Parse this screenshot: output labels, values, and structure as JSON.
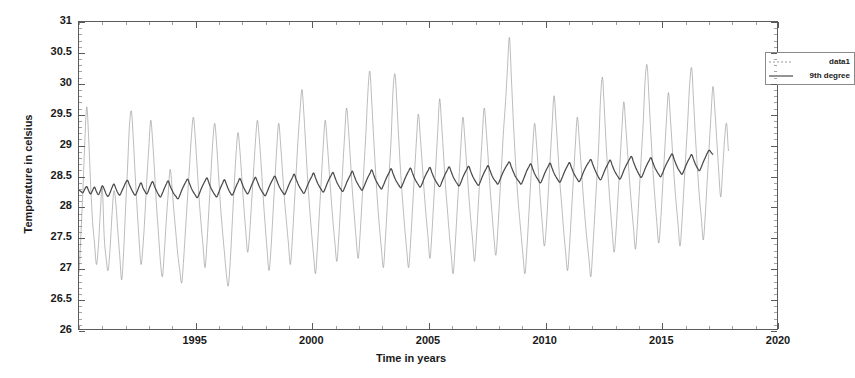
{
  "chart_data": {
    "type": "line",
    "title": "",
    "xlabel": "Time in years",
    "ylabel": "Temperature in celsius",
    "xlim": [
      1990,
      2020
    ],
    "ylim": [
      26,
      31
    ],
    "xticks": [
      1995,
      2000,
      2005,
      2010,
      2015,
      2020
    ],
    "xtick_labels": [
      "1995",
      "2000",
      "2005",
      "2010",
      "2015",
      "2020"
    ],
    "xtick_minor_step": 1,
    "yticks": [
      26,
      26.5,
      27,
      27.5,
      28,
      28.5,
      29,
      29.5,
      30,
      30.5,
      31
    ],
    "ytick_labels": [
      "26",
      "26.5",
      "27",
      "27.5",
      "28",
      "28.5",
      "29",
      "29.5",
      "30",
      "30.5",
      "31"
    ],
    "grid": false,
    "legend_position": "top-right",
    "series": [
      {
        "name": "data1",
        "style": "thin-noisy",
        "color": "#8f8f8f",
        "linewidth": 0.5,
        "x_start": 1990.0,
        "x_step": 0.08333,
        "values": [
          26.92,
          27.55,
          28.25,
          29.05,
          29.62,
          29.1,
          28.35,
          27.75,
          27.4,
          27.05,
          27.35,
          27.9,
          28.3,
          27.5,
          27.15,
          26.95,
          27.3,
          27.85,
          28.25,
          28.05,
          27.6,
          27.2,
          26.8,
          27.25,
          27.95,
          28.6,
          29.3,
          29.55,
          29.1,
          28.5,
          27.95,
          27.45,
          27.05,
          27.35,
          27.85,
          28.45,
          28.95,
          29.4,
          29.05,
          28.55,
          28.0,
          27.55,
          27.1,
          26.85,
          27.25,
          27.75,
          28.2,
          28.6,
          28.3,
          27.9,
          27.55,
          27.2,
          26.95,
          26.75,
          27.15,
          27.65,
          28.15,
          28.65,
          29.15,
          29.45,
          29.1,
          28.6,
          28.1,
          27.7,
          27.35,
          27.0,
          27.4,
          27.95,
          28.5,
          29.05,
          29.35,
          29.0,
          28.5,
          28.0,
          27.6,
          27.25,
          26.9,
          26.7,
          27.1,
          27.7,
          28.3,
          28.85,
          29.2,
          28.9,
          28.45,
          28.0,
          27.6,
          27.25,
          27.55,
          28.05,
          28.55,
          29.05,
          29.4,
          29.1,
          28.65,
          28.15,
          27.7,
          27.3,
          26.95,
          27.3,
          27.85,
          28.4,
          28.95,
          29.35,
          29.0,
          28.55,
          28.1,
          27.75,
          27.4,
          27.05,
          27.45,
          28.0,
          28.55,
          29.1,
          29.55,
          29.9,
          29.5,
          28.95,
          28.4,
          27.95,
          27.55,
          27.2,
          26.9,
          27.35,
          27.9,
          28.45,
          29.0,
          29.4,
          29.05,
          28.6,
          28.15,
          27.75,
          27.4,
          27.1,
          27.5,
          28.05,
          28.6,
          29.15,
          29.6,
          29.25,
          28.75,
          28.25,
          27.85,
          27.45,
          27.15,
          27.55,
          28.1,
          28.65,
          29.2,
          29.85,
          30.2,
          29.7,
          29.1,
          28.55,
          28.05,
          27.65,
          27.3,
          27.0,
          27.45,
          28.0,
          28.55,
          29.1,
          29.9,
          30.15,
          29.65,
          29.05,
          28.5,
          28.05,
          27.65,
          27.3,
          27.0,
          27.4,
          27.95,
          28.5,
          29.05,
          29.5,
          29.15,
          28.7,
          28.25,
          27.85,
          27.5,
          27.15,
          27.55,
          28.1,
          28.65,
          29.2,
          29.75,
          29.35,
          28.85,
          28.35,
          27.95,
          27.55,
          27.2,
          26.9,
          27.35,
          27.9,
          28.45,
          29.0,
          29.45,
          29.1,
          28.65,
          28.2,
          27.8,
          27.45,
          27.1,
          27.5,
          28.05,
          28.6,
          29.15,
          29.6,
          29.25,
          28.8,
          28.3,
          27.9,
          27.5,
          27.2,
          27.6,
          28.15,
          28.7,
          29.25,
          29.7,
          30.25,
          30.75,
          30.1,
          29.4,
          28.8,
          28.3,
          27.9,
          27.55,
          27.2,
          26.9,
          27.3,
          27.85,
          28.4,
          28.95,
          29.35,
          29.0,
          28.55,
          28.1,
          27.7,
          27.35,
          27.65,
          28.2,
          28.75,
          29.3,
          29.8,
          29.4,
          28.9,
          28.4,
          28.0,
          27.6,
          27.25,
          26.95,
          27.35,
          27.9,
          28.45,
          29.0,
          29.45,
          29.1,
          28.65,
          28.2,
          27.8,
          27.45,
          27.15,
          26.85,
          27.3,
          27.85,
          28.4,
          28.95,
          29.75,
          30.1,
          29.55,
          28.95,
          28.45,
          28.0,
          27.6,
          27.25,
          27.6,
          28.15,
          28.7,
          29.25,
          29.7,
          29.3,
          28.85,
          28.4,
          28.0,
          27.65,
          27.3,
          27.7,
          28.25,
          28.8,
          29.35,
          30.05,
          30.3,
          29.75,
          29.15,
          28.6,
          28.15,
          27.75,
          27.4,
          27.75,
          28.3,
          28.85,
          29.4,
          29.85,
          29.45,
          28.95,
          28.45,
          28.05,
          27.7,
          27.35,
          27.75,
          28.3,
          28.85,
          29.4,
          30.0,
          30.25,
          29.7,
          29.1,
          28.6,
          28.15,
          27.8,
          27.45,
          27.85,
          28.4,
          28.95,
          29.5,
          29.95,
          29.55,
          29.05,
          28.55,
          28.15,
          28.6,
          29.1,
          29.35,
          28.9
        ]
      },
      {
        "name": "9th degree",
        "style": "thick-smooth",
        "color": "#4a4a4a",
        "linewidth": 1.3,
        "x_start": 1990.0,
        "x_step": 0.08333,
        "values": [
          28.26,
          28.24,
          28.22,
          28.28,
          28.32,
          28.25,
          28.2,
          28.26,
          28.31,
          28.24,
          28.19,
          28.25,
          28.33,
          28.28,
          28.2,
          28.16,
          28.22,
          28.3,
          28.36,
          28.29,
          28.22,
          28.18,
          28.24,
          28.31,
          28.38,
          28.42,
          28.35,
          28.28,
          28.22,
          28.18,
          28.24,
          28.32,
          28.38,
          28.3,
          28.24,
          28.2,
          28.27,
          28.35,
          28.4,
          28.32,
          28.25,
          28.19,
          28.15,
          28.21,
          28.29,
          28.36,
          28.41,
          28.33,
          28.26,
          28.2,
          28.16,
          28.12,
          28.18,
          28.26,
          28.33,
          28.39,
          28.44,
          28.37,
          28.29,
          28.23,
          28.18,
          28.14,
          28.2,
          28.28,
          28.35,
          28.41,
          28.46,
          28.38,
          28.3,
          28.24,
          28.19,
          28.15,
          28.22,
          28.3,
          28.37,
          28.43,
          28.36,
          28.28,
          28.22,
          28.18,
          28.24,
          28.32,
          28.39,
          28.45,
          28.38,
          28.3,
          28.24,
          28.2,
          28.26,
          28.34,
          28.41,
          28.47,
          28.4,
          28.32,
          28.26,
          28.21,
          28.17,
          28.23,
          28.31,
          28.38,
          28.44,
          28.49,
          28.42,
          28.34,
          28.28,
          28.23,
          28.19,
          28.25,
          28.33,
          28.4,
          28.46,
          28.52,
          28.44,
          28.36,
          28.3,
          28.25,
          28.21,
          28.27,
          28.35,
          28.42,
          28.48,
          28.54,
          28.46,
          28.38,
          28.32,
          28.27,
          28.23,
          28.29,
          28.37,
          28.44,
          28.5,
          28.55,
          28.47,
          28.39,
          28.33,
          28.28,
          28.24,
          28.3,
          28.38,
          28.45,
          28.51,
          28.57,
          28.49,
          28.41,
          28.35,
          28.3,
          28.26,
          28.32,
          28.4,
          28.47,
          28.53,
          28.59,
          28.51,
          28.43,
          28.37,
          28.32,
          28.28,
          28.34,
          28.42,
          28.49,
          28.55,
          28.61,
          28.53,
          28.45,
          28.39,
          28.34,
          28.3,
          28.36,
          28.44,
          28.51,
          28.57,
          28.62,
          28.54,
          28.46,
          28.4,
          28.35,
          28.31,
          28.37,
          28.45,
          28.52,
          28.58,
          28.63,
          28.55,
          28.47,
          28.41,
          28.36,
          28.32,
          28.38,
          28.46,
          28.53,
          28.59,
          28.64,
          28.56,
          28.48,
          28.42,
          28.37,
          28.33,
          28.39,
          28.47,
          28.54,
          28.6,
          28.65,
          28.57,
          28.49,
          28.43,
          28.38,
          28.34,
          28.4,
          28.48,
          28.55,
          28.61,
          28.66,
          28.58,
          28.5,
          28.44,
          28.4,
          28.36,
          28.42,
          28.5,
          28.57,
          28.63,
          28.68,
          28.72,
          28.64,
          28.56,
          28.49,
          28.44,
          28.4,
          28.36,
          28.42,
          28.5,
          28.58,
          28.64,
          28.69,
          28.61,
          28.53,
          28.47,
          28.42,
          28.38,
          28.44,
          28.52,
          28.59,
          28.65,
          28.7,
          28.62,
          28.54,
          28.48,
          28.43,
          28.39,
          28.45,
          28.53,
          28.6,
          28.66,
          28.71,
          28.63,
          28.55,
          28.49,
          28.44,
          28.4,
          28.46,
          28.54,
          28.61,
          28.67,
          28.72,
          28.76,
          28.68,
          28.6,
          28.53,
          28.47,
          28.43,
          28.49,
          28.57,
          28.64,
          28.7,
          28.75,
          28.67,
          28.59,
          28.53,
          28.48,
          28.44,
          28.5,
          28.58,
          28.65,
          28.71,
          28.77,
          28.81,
          28.72,
          28.64,
          28.57,
          28.51,
          28.47,
          28.53,
          28.61,
          28.68,
          28.74,
          28.79,
          28.71,
          28.63,
          28.57,
          28.52,
          28.48,
          28.54,
          28.62,
          28.69,
          28.75,
          28.81,
          28.85,
          28.76,
          28.68,
          28.61,
          28.56,
          28.52,
          28.58,
          28.66,
          28.73,
          28.79,
          28.84,
          28.76,
          28.68,
          28.62,
          28.58,
          28.64,
          28.72,
          28.79,
          28.86,
          28.91,
          28.88,
          28.84
        ]
      }
    ]
  },
  "legend": {
    "entries": [
      {
        "label": "data1"
      },
      {
        "label": "9th degree"
      }
    ]
  }
}
